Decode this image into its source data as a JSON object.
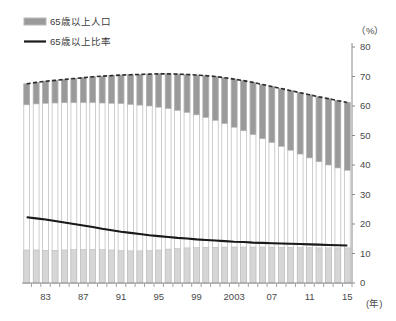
{
  "legend": {
    "position": "top-left",
    "items": [
      {
        "label": "65歳以上人口",
        "marker": "bar-swatch",
        "color": "#9a9a9a"
      },
      {
        "label": "65歳以上比率",
        "marker": "line-swatch",
        "color": "#1a1a1a"
      }
    ]
  },
  "axis": {
    "y_unit_label": "（%）",
    "x_unit_label": "(年)"
  },
  "colors": {
    "bar_top_fill": "#9a9a9a",
    "bar_bottom_fill": "#d6d6d6",
    "bar_outline": "#b8b8b8",
    "ratio_line": "#1a1a1a",
    "secondary_line": "#8c8c8c",
    "dashed_top_line": "#2b2b2b",
    "axis": "#8a8a8a",
    "text": "#4a4a4a"
  },
  "chart_data": {
    "type": "bar",
    "title": "",
    "subtitle": "",
    "xlabel": "(年)",
    "ylabel": "（%）",
    "ylim": [
      0,
      80
    ],
    "ytick_step": 10,
    "yticks": [
      0,
      10,
      20,
      30,
      40,
      50,
      60,
      70,
      80
    ],
    "ytick_labels": [
      "0",
      "10",
      "20",
      "30",
      "40",
      "50",
      "60",
      "70",
      "80"
    ],
    "grid": false,
    "legend_position": "top-left",
    "x": [
      1981,
      1982,
      1983,
      1984,
      1985,
      1986,
      1987,
      1988,
      1989,
      1990,
      1991,
      1992,
      1993,
      1994,
      1995,
      1996,
      1997,
      1998,
      1999,
      2000,
      2001,
      2002,
      2003,
      2004,
      2005,
      2006,
      2007,
      2008,
      2009,
      2010,
      2011,
      2012,
      2013,
      2014,
      2015
    ],
    "xtick_positions": [
      1983,
      1987,
      1991,
      1995,
      1999,
      2003,
      2007,
      2011,
      2015
    ],
    "xtick_labels": [
      "83",
      "87",
      "91",
      "95",
      "99",
      "2003",
      "07",
      "11",
      "15"
    ],
    "series": [
      {
        "name": "65歳以上人口",
        "type": "bar-segment-top",
        "note": "濃い灰色の上部セグメント（棒の上端から下端までの差）",
        "values": [
          7.1,
          7.3,
          7.5,
          7.7,
          7.9,
          8.2,
          8.5,
          8.8,
          9.1,
          9.4,
          9.7,
          10.1,
          10.4,
          10.8,
          11.3,
          11.8,
          12.3,
          12.9,
          13.5,
          14.2,
          14.9,
          15.6,
          16.3,
          17.0,
          17.7,
          18.4,
          19.0,
          19.6,
          20.2,
          20.8,
          21.4,
          22.0,
          22.5,
          22.8,
          23.0
        ]
      },
      {
        "name": "棒上端（総数）",
        "type": "bar-total",
        "note": "棒全体の上端の値",
        "values": [
          67.5,
          68.0,
          68.4,
          68.7,
          69.0,
          69.3,
          69.6,
          69.9,
          70.1,
          70.3,
          70.5,
          70.6,
          70.7,
          70.8,
          70.9,
          70.9,
          70.8,
          70.7,
          70.5,
          70.3,
          70.0,
          69.6,
          69.1,
          68.6,
          68.0,
          67.3,
          66.6,
          65.9,
          65.2,
          64.5,
          63.8,
          63.1,
          62.5,
          61.8,
          61.2
        ]
      },
      {
        "name": "棒下部の薄灰色帯（上端値）",
        "type": "bar-segment-bottom",
        "values": [
          11.2,
          11.2,
          11.1,
          11.1,
          11.2,
          11.3,
          11.4,
          11.4,
          11.3,
          11.2,
          11.0,
          10.9,
          10.9,
          11.0,
          11.2,
          11.5,
          11.7,
          11.9,
          12.0,
          12.1,
          12.1,
          12.2,
          12.2,
          12.2,
          12.2,
          12.2,
          12.2,
          12.1,
          12.1,
          12.0,
          12.0,
          11.9,
          11.9,
          11.9,
          11.9
        ]
      },
      {
        "name": "65歳以上比率",
        "type": "line",
        "color": "#1a1a1a",
        "values": [
          9.1,
          9.4,
          9.7,
          10.0,
          10.3,
          10.6,
          10.9,
          11.2,
          11.6,
          12.1,
          12.6,
          13.1,
          13.6,
          14.1,
          14.6,
          15.1,
          15.7,
          16.2,
          16.7,
          17.4,
          18.0,
          18.5,
          19.0,
          19.6,
          20.2,
          20.8,
          21.5,
          22.1,
          22.8,
          23.0,
          23.3,
          24.1,
          25.1,
          26.0,
          26.7
        ]
      },
      {
        "name": "細い灰色の線",
        "type": "line",
        "color": "#8c8c8c",
        "values": [
          22.3,
          21.9,
          21.5,
          21.0,
          20.5,
          20.0,
          19.5,
          19.0,
          18.4,
          17.9,
          17.4,
          17.0,
          16.6,
          16.2,
          15.9,
          15.6,
          15.3,
          15.1,
          14.8,
          14.6,
          14.4,
          14.2,
          14.0,
          13.9,
          13.7,
          13.6,
          13.5,
          13.4,
          13.3,
          13.2,
          13.1,
          13.0,
          12.9,
          12.8,
          12.7
        ]
      },
      {
        "name": "棒上端の破線",
        "type": "dashed-line",
        "color": "#2b2b2b",
        "values": [
          67.5,
          68.0,
          68.4,
          68.7,
          69.0,
          69.3,
          69.6,
          69.9,
          70.1,
          70.3,
          70.5,
          70.6,
          70.7,
          70.8,
          70.9,
          70.9,
          70.8,
          70.7,
          70.5,
          70.3,
          70.0,
          69.6,
          69.1,
          68.6,
          68.0,
          67.3,
          66.6,
          65.9,
          65.2,
          64.5,
          63.8,
          63.1,
          62.5,
          61.8,
          61.2
        ]
      }
    ]
  }
}
